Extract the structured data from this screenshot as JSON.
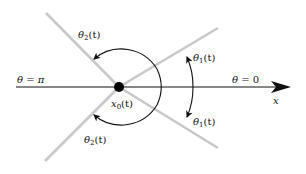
{
  "diagram": {
    "type": "angle-geometry",
    "center_point": {
      "label_var": "x",
      "label_sub": "0",
      "label_arg": "(t)",
      "color": "#000000"
    },
    "axis": {
      "label": "x",
      "color": "#000000"
    },
    "rays_color": "#c8c8c8",
    "arc_color": "#111111",
    "labels": {
      "theta_pi": {
        "lhs": "θ",
        "rel": " = ",
        "rhs": "π"
      },
      "theta_zero": {
        "lhs": "θ",
        "rel": " = ",
        "rhs": "0"
      },
      "theta1_upper": {
        "var": "θ",
        "sub": "1",
        "arg": "(t)"
      },
      "theta1_lower": {
        "var": "θ",
        "sub": "1",
        "arg": "(t)"
      },
      "theta2_upper": {
        "var": "θ",
        "sub": "2",
        "arg": "(t)"
      },
      "theta2_lower": {
        "var": "θ",
        "sub": "2",
        "arg": "(t)"
      }
    }
  }
}
